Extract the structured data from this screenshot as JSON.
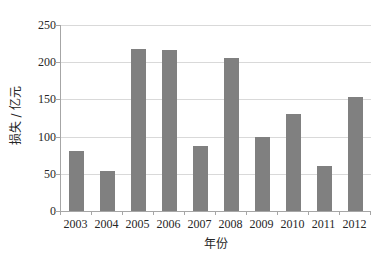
{
  "chart_data": {
    "type": "bar",
    "title": "",
    "subtitle": "",
    "xlabel": "年份",
    "ylabel": "损失 / 亿元",
    "categories": [
      "2003",
      "2004",
      "2005",
      "2006",
      "2007",
      "2008",
      "2009",
      "2010",
      "2011",
      "2012"
    ],
    "values": [
      80,
      54,
      218,
      216,
      87,
      205,
      99,
      131,
      60,
      153
    ],
    "ylim": [
      0,
      250
    ],
    "yticks": [
      0,
      50,
      100,
      150,
      200,
      250
    ],
    "ytick_labels": [
      "0",
      "50",
      "100",
      "150",
      "200",
      "250"
    ],
    "grid": true,
    "legend": false,
    "legend_position": "none",
    "bar_color": "#808080",
    "gridline_color": "#d9d9d9",
    "axis_color": "#a6a6a6",
    "background_color": "#ffffff"
  }
}
